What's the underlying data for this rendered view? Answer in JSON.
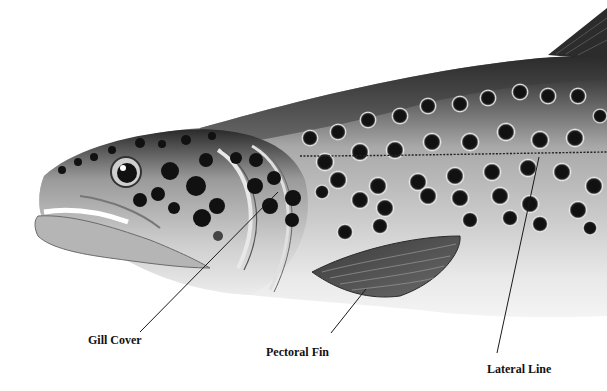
{
  "figure": {
    "background": "#ffffff",
    "palette": {
      "dark": "#141414",
      "mid": "#7a7a7a",
      "light": "#d9d9d9",
      "belly": "#efefef",
      "leader": "#1a1a1a"
    }
  },
  "labels": [
    {
      "id": "gill-cover",
      "text": "Gill Cover",
      "x": 88,
      "y": 333,
      "pointer": {
        "x1": 140,
        "y1": 332,
        "x2": 278,
        "y2": 192
      }
    },
    {
      "id": "pectoral-fin",
      "text": "Pectoral Fin",
      "x": 266,
      "y": 345,
      "pointer": {
        "x1": 331,
        "y1": 333,
        "x2": 366,
        "y2": 289
      }
    },
    {
      "id": "lateral-line",
      "text": "Lateral Line",
      "x": 487,
      "y": 362,
      "pointer": {
        "x1": 497,
        "y1": 353,
        "x2": 539,
        "y2": 157
      }
    }
  ]
}
